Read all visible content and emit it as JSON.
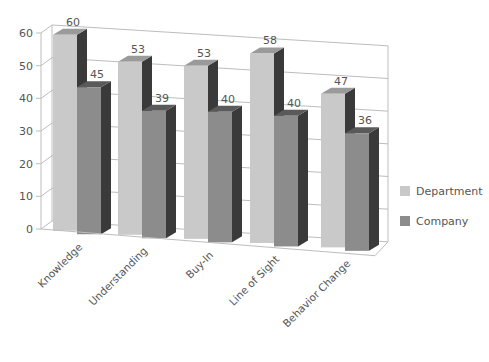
{
  "chart_data": {
    "type": "bar",
    "style": "3d-clustered-column",
    "title": "",
    "xlabel": "",
    "ylabel": "",
    "ylim": [
      0,
      60
    ],
    "yticks": [
      0,
      10,
      20,
      30,
      40,
      50,
      60
    ],
    "grid": true,
    "legend_position": "right",
    "categories": [
      "Knowledge",
      "Understanding",
      "Buy-In",
      "Line of Sight",
      "Behavior Change"
    ],
    "series": [
      {
        "name": "Department",
        "values": [
          60,
          53,
          53,
          58,
          47
        ],
        "color": "#c9c9c9"
      },
      {
        "name": "Company",
        "values": [
          45,
          39,
          40,
          40,
          36
        ],
        "color": "#8c8c8c"
      }
    ]
  },
  "legend": {
    "items": [
      {
        "label": "Department",
        "color": "#c9c9c9"
      },
      {
        "label": "Company",
        "color": "#8c8c8c"
      }
    ]
  },
  "colors": {
    "side": "#3a3a3a",
    "top_department": "#9a9a9a",
    "top_company": "#5a5a5a",
    "grid": "#bdbdbd",
    "text": "#555555"
  }
}
